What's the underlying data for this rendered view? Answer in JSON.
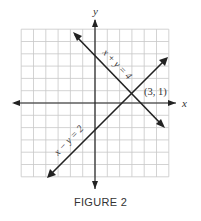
{
  "chart_data": {
    "type": "line",
    "title": "",
    "caption": "FIGURE 2",
    "xlabel": "x",
    "ylabel": "y",
    "xlim": [
      -6,
      6
    ],
    "ylim": [
      -6,
      6
    ],
    "grid": true,
    "series": [
      {
        "name": "x + y = 4",
        "equation": "x + y = 4",
        "points": [
          [
            -1,
            5
          ],
          [
            6,
            -2
          ]
        ]
      },
      {
        "name": "x − y = 2",
        "equation": "x - y = 2",
        "points": [
          [
            -4,
            -6
          ],
          [
            6,
            4
          ]
        ]
      }
    ],
    "annotations": [
      {
        "text": "(3, 1)",
        "x": 3,
        "y": 1
      }
    ]
  },
  "figure": {
    "caption": "FIGURE 2",
    "x_axis_label": "x",
    "y_axis_label": "y",
    "line1_label": "x + y = 4",
    "line2_label": "x − y = 2",
    "intersection_label": "(3, 1)"
  }
}
